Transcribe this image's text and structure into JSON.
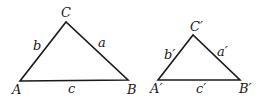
{
  "figure": {
    "triangle1": {
      "vertices": {
        "A": "A",
        "B": "B",
        "C": "C"
      },
      "sides": {
        "a": "a",
        "b": "b",
        "c": "c"
      }
    },
    "triangle2": {
      "vertices": {
        "A": "A′",
        "B": "B′",
        "C": "C′"
      },
      "sides": {
        "a": "a′",
        "b": "b′",
        "c": "c′"
      }
    },
    "colors": {
      "stroke": "#1a1a1a",
      "background": "#ffffff"
    }
  }
}
